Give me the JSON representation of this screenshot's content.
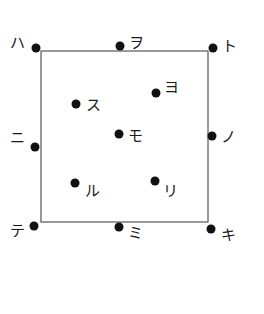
{
  "diagram": {
    "square": {
      "x": 41,
      "y": 51,
      "width": 167,
      "height": 171,
      "stroke": "#555555"
    },
    "dot_color": "#111111",
    "points": [
      {
        "label": "ハ",
        "x": 36,
        "y": 48,
        "lx": 10,
        "ly": 48
      },
      {
        "label": "ヲ",
        "x": 120,
        "y": 46,
        "lx": 129,
        "ly": 48
      },
      {
        "label": "ト",
        "x": 213,
        "y": 48,
        "lx": 222,
        "ly": 51
      },
      {
        "label": "ヨ",
        "x": 156,
        "y": 93,
        "lx": 164,
        "ly": 92
      },
      {
        "label": "ス",
        "x": 76,
        "y": 104,
        "lx": 86,
        "ly": 110
      },
      {
        "label": "ニ",
        "x": 35,
        "y": 147,
        "lx": 10,
        "ly": 143
      },
      {
        "label": "モ",
        "x": 119,
        "y": 134,
        "lx": 128,
        "ly": 141
      },
      {
        "label": "ノ",
        "x": 212,
        "y": 136,
        "lx": 221,
        "ly": 142
      },
      {
        "label": "ル",
        "x": 75,
        "y": 183,
        "lx": 85,
        "ly": 196
      },
      {
        "label": "リ",
        "x": 155,
        "y": 181,
        "lx": 163,
        "ly": 196
      },
      {
        "label": "テ",
        "x": 34,
        "y": 226,
        "lx": 10,
        "ly": 236
      },
      {
        "label": "ミ",
        "x": 119,
        "y": 227,
        "lx": 128,
        "ly": 238
      },
      {
        "label": "キ",
        "x": 211,
        "y": 229,
        "lx": 221,
        "ly": 240
      }
    ]
  }
}
